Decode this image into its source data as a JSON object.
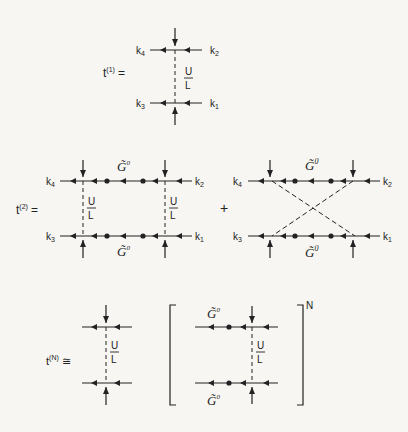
{
  "figure": {
    "t1": {
      "label_main": "t",
      "label_sup": "(1)",
      "label_eq": "=",
      "k_top_left": "k",
      "k_top_left_sub": "4",
      "k_top_right": "k",
      "k_top_right_sub": "2",
      "k_bot_left": "k",
      "k_bot_left_sub": "3",
      "k_bot_right": "k",
      "k_bot_right_sub": "1",
      "interaction_num": "U",
      "interaction_den": "L"
    },
    "t2": {
      "label_main": "t",
      "label_sup": "(2)",
      "label_eq": "=",
      "plus": "+",
      "ladder": {
        "k_top_left": "k",
        "k_top_left_sub": "4",
        "k_top_right": "k",
        "k_top_right_sub": "2",
        "k_bot_left": "k",
        "k_bot_left_sub": "3",
        "k_bot_right": "k",
        "k_bot_right_sub": "1",
        "propagator_top": "G̃",
        "propagator_top_sup": "0",
        "propagator_bottom": "G̃",
        "propagator_bottom_sup": "0",
        "interaction_num": "U",
        "interaction_den": "L"
      },
      "crossed": {
        "k_top_left": "k",
        "k_top_left_sub": "4",
        "k_top_right": "k",
        "k_top_right_sub": "2",
        "k_bot_left": "k",
        "k_bot_left_sub": "3",
        "k_bot_right": "k",
        "k_bot_right_sub": "1",
        "propagator_top": "G̃",
        "propagator_top_sup": "0",
        "propagator_bottom": "G̃",
        "propagator_bottom_sup": "0"
      }
    },
    "tN": {
      "label_main": "t",
      "label_sup": "(N)",
      "label_eq": "≅",
      "interaction_num": "U",
      "interaction_den": "L",
      "bracket": {
        "propagator_top": "G̃",
        "propagator_top_sup": "0",
        "propagator_bottom": "G̃",
        "propagator_bottom_sup": "0",
        "interaction_num": "U",
        "interaction_den": "L",
        "power": "N"
      }
    }
  }
}
